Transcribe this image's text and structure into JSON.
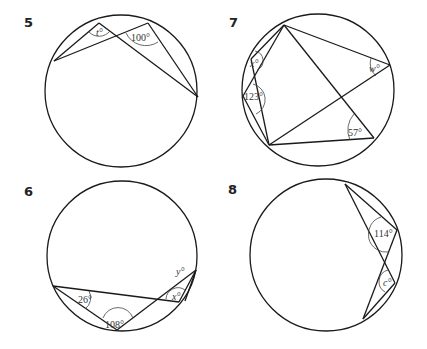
{
  "diagrams": [
    {
      "number": "5",
      "labels": {
        "angle_unknown": "t°",
        "angle_given": "100°"
      }
    },
    {
      "number": "7",
      "labels": {
        "angle_x": "x°",
        "angle_123": "123°",
        "angle_w": "w°",
        "angle_57": "57°"
      }
    },
    {
      "number": "6",
      "labels": {
        "angle_26": "26°",
        "angle_108": "108°",
        "angle_x": "x°",
        "angle_y": "y°"
      }
    },
    {
      "number": "8",
      "labels": {
        "angle_114": "114°",
        "angle_c": "c°"
      }
    }
  ],
  "colors": {
    "stroke": "#1a1a1a",
    "background": "#ffffff"
  }
}
